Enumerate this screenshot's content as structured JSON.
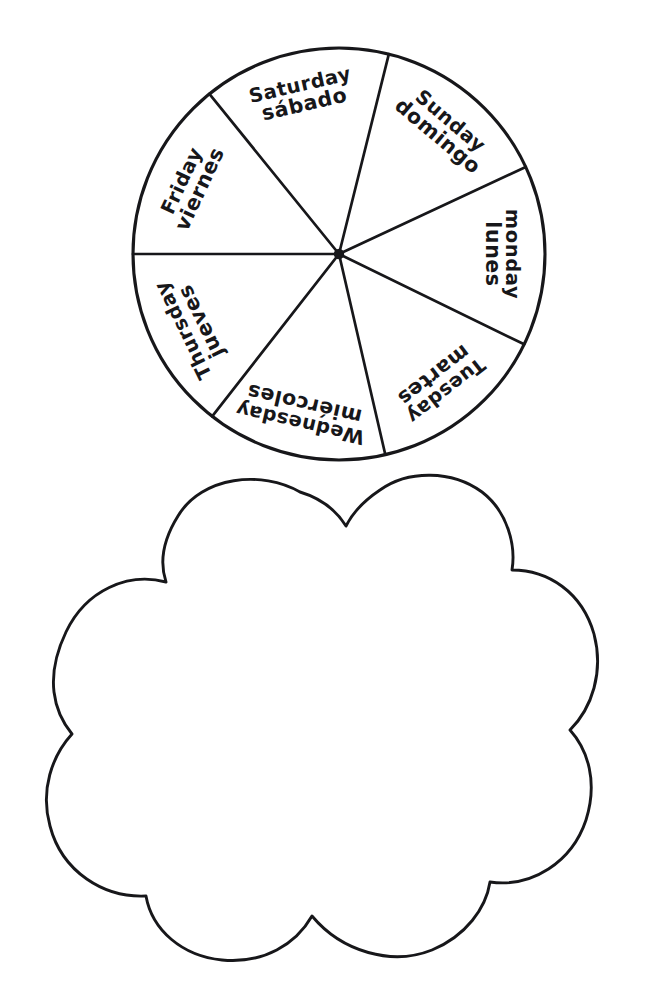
{
  "page": {
    "background_color": "#ffffff",
    "ink_color": "#17171a",
    "width": 667,
    "height": 991
  },
  "spinner_wheel": {
    "name": "days-of-the-week-wheel",
    "center_x": 339,
    "center_y": 254,
    "radius": 206,
    "segment_count": 7,
    "hub_label": "center-pivot-dot",
    "segments": [
      {
        "index": 0,
        "english": "Sunday",
        "spanish": "domingo",
        "start_angle_deg": -76,
        "end_angle_deg": -25,
        "text_angle_deg": -50,
        "text_radius": 163
      },
      {
        "index": 1,
        "english": "monday",
        "spanish": "lunes",
        "start_angle_deg": -25,
        "end_angle_deg": 26,
        "text_angle_deg": 0,
        "text_radius": 163
      },
      {
        "index": 2,
        "english": "Tuesday",
        "spanish": "martes",
        "start_angle_deg": 26,
        "end_angle_deg": 77,
        "text_angle_deg": 52,
        "text_radius": 163
      },
      {
        "index": 3,
        "english": "Wednesday",
        "spanish": "miércoles",
        "start_angle_deg": 77,
        "end_angle_deg": 128,
        "text_angle_deg": 103,
        "text_radius": 163
      },
      {
        "index": 4,
        "english": "Thursday",
        "spanish": "jueves",
        "start_angle_deg": 128,
        "end_angle_deg": 180,
        "text_angle_deg": 154,
        "text_radius": 163
      },
      {
        "index": 5,
        "english": "Friday",
        "spanish": "viernes",
        "start_angle_deg": 180,
        "end_angle_deg": 231,
        "text_angle_deg": 205,
        "text_radius": 163
      },
      {
        "index": 6,
        "english": "Saturday",
        "spanish": "sábado",
        "start_angle_deg": 231,
        "end_angle_deg": 284,
        "text_angle_deg": 257,
        "text_radius": 163
      }
    ]
  },
  "cloud_shape": {
    "name": "cloud-cutout-outline",
    "description": "scalloped cloud / flower outline cut-out region",
    "bounds": {
      "left": 35,
      "top": 480,
      "right": 602,
      "bottom": 962
    },
    "bump_count": 9,
    "path": "M 300 492 C 262 470 202 476 178 516 C 158 548 162 570 166 582 C 128 572 86 590 66 632 C 44 678 54 712 72 734 C 52 756 40 790 50 826 C 62 872 104 898 146 896 C 152 930 182 956 222 960 C 264 964 296 944 312 916 C 342 952 392 966 432 950 C 466 936 486 908 490 882 C 532 888 572 862 586 820 C 598 782 588 750 570 730 C 592 708 604 672 594 634 C 582 592 548 570 512 570 C 516 546 508 512 482 492 C 452 470 408 470 380 490 C 362 502 352 514 346 526 C 336 510 320 498 300 492 Z"
  },
  "footer_watermark": {
    "text": "",
    "visible": false
  }
}
